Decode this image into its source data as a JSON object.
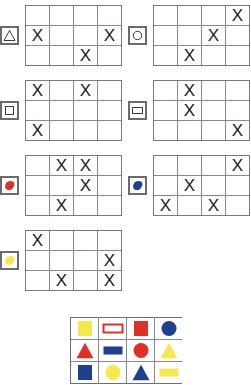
{
  "colors": {
    "red": "#e03026",
    "blue": "#1f3f8f",
    "yellow": "#f5e94b",
    "grid_line": "#8a8a8a",
    "grid_border": "#7a7a7a",
    "badge_border": "#6b6b6b",
    "mark_color": "#1a1a1a"
  },
  "mark": "X",
  "grid": {
    "cols": 4,
    "rows": 3
  },
  "puzzles": [
    {
      "id": "puzzle-triangle",
      "badge": {
        "icon": "triangle-outline-icon",
        "label": "triangle"
      },
      "cells": [
        [
          "",
          "",
          "",
          ""
        ],
        [
          "X",
          "",
          "",
          "X"
        ],
        [
          "",
          "",
          "X",
          ""
        ]
      ]
    },
    {
      "id": "puzzle-circle",
      "badge": {
        "icon": "circle-outline-icon",
        "label": "circle"
      },
      "cells": [
        [
          "",
          "",
          "",
          "X"
        ],
        [
          "",
          "",
          "X",
          ""
        ],
        [
          "",
          "X",
          "",
          ""
        ]
      ]
    },
    {
      "id": "puzzle-square",
      "badge": {
        "icon": "square-outline-icon",
        "label": "square"
      },
      "cells": [
        [
          "X",
          "",
          "X",
          ""
        ],
        [
          "",
          "",
          "",
          ""
        ],
        [
          "X",
          "",
          "",
          ""
        ]
      ]
    },
    {
      "id": "puzzle-rectangle",
      "badge": {
        "icon": "rectangle-outline-icon",
        "label": "rectangle"
      },
      "cells": [
        [
          "",
          "X",
          "",
          ""
        ],
        [
          "",
          "X",
          "",
          ""
        ],
        [
          "",
          "",
          "",
          "X"
        ]
      ]
    },
    {
      "id": "puzzle-red-blob",
      "badge": {
        "icon": "red-blob-icon",
        "label": "red"
      },
      "cells": [
        [
          "",
          "X",
          "X",
          ""
        ],
        [
          "",
          "",
          "X",
          ""
        ],
        [
          "",
          "X",
          "",
          ""
        ]
      ]
    },
    {
      "id": "puzzle-blue-blob",
      "badge": {
        "icon": "blue-blob-icon",
        "label": "blue"
      },
      "cells": [
        [
          "",
          "",
          "",
          "X"
        ],
        [
          "",
          "X",
          "",
          ""
        ],
        [
          "X",
          "",
          "X",
          ""
        ]
      ]
    },
    {
      "id": "puzzle-yellow-blob",
      "badge": {
        "icon": "yellow-blob-icon",
        "label": "yellow"
      },
      "cells": [
        [
          "X",
          "",
          "",
          ""
        ],
        [
          "",
          "",
          "",
          "X"
        ],
        [
          "",
          "X",
          "",
          "X"
        ]
      ]
    }
  ],
  "palette": {
    "cols": 4,
    "rows": 3,
    "items": [
      {
        "icon": "yellow-square-icon",
        "shape": "square",
        "color": "yellow",
        "filled": true
      },
      {
        "icon": "red-rectangle-outline-icon",
        "shape": "rectangle",
        "color": "red",
        "filled": false
      },
      {
        "icon": "red-square-icon",
        "shape": "square",
        "color": "red",
        "filled": true
      },
      {
        "icon": "blue-circle-icon",
        "shape": "circle",
        "color": "blue",
        "filled": true
      },
      {
        "icon": "red-triangle-icon",
        "shape": "triangle",
        "color": "red",
        "filled": true
      },
      {
        "icon": "blue-rectangle-icon",
        "shape": "rectangle",
        "color": "blue",
        "filled": true
      },
      {
        "icon": "red-circle-icon",
        "shape": "circle",
        "color": "red",
        "filled": true
      },
      {
        "icon": "yellow-triangle-icon",
        "shape": "triangle",
        "color": "yellow",
        "filled": true
      },
      {
        "icon": "blue-square-icon",
        "shape": "square",
        "color": "blue",
        "filled": true
      },
      {
        "icon": "yellow-circle-icon",
        "shape": "circle",
        "color": "yellow",
        "filled": true
      },
      {
        "icon": "blue-triangle-icon",
        "shape": "triangle",
        "color": "blue",
        "filled": true
      },
      {
        "icon": "yellow-rectangle-icon",
        "shape": "rectangle",
        "color": "yellow",
        "filled": true
      }
    ]
  },
  "layout": {
    "blocks": [
      {
        "left": 0,
        "top": 5,
        "badge_side": "left"
      },
      {
        "left": 128,
        "top": 5,
        "badge_side": "left"
      },
      {
        "left": 0,
        "top": 80,
        "badge_side": "left"
      },
      {
        "left": 128,
        "top": 80,
        "badge_side": "left"
      },
      {
        "left": 0,
        "top": 155,
        "badge_side": "left"
      },
      {
        "left": 128,
        "top": 155,
        "badge_side": "left"
      },
      {
        "left": 0,
        "top": 230,
        "badge_side": "left"
      }
    ]
  }
}
